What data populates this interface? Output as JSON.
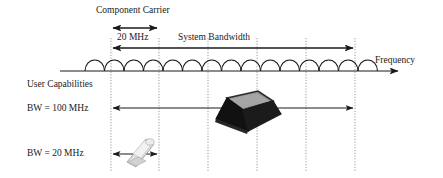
{
  "diagram": {
    "background_color": "#ffffff",
    "stroke_color": "#1a1a1a",
    "labels": {
      "component_carrier": "Component Carrier",
      "carrier_width": "20 MHz",
      "system_bandwidth": "System Bandwidth",
      "frequency_axis": "Frequency",
      "user_capabilities": "User Capabilities",
      "bw_100": "BW = 100 MHz",
      "bw_20": "BW = 20 MHz"
    },
    "axis": {
      "name": "frequency-axis",
      "y": 71,
      "x_start": 60,
      "x_end": 400,
      "arrow": "right"
    },
    "carrier_arcs": {
      "name": "component-carrier-arcs",
      "count": 15,
      "x_start": 85,
      "x_end": 378,
      "arc_width": 19.5,
      "arc_height": 11,
      "baseline_y": 71
    },
    "grid_lines": {
      "name": "carrier-boundary-dotted-lines",
      "style": "dotted",
      "color": "#9a9a9a",
      "x_positions": [
        111,
        159,
        208,
        257,
        306,
        355
      ],
      "y_top": 38,
      "y_bottom": 172
    },
    "measures": [
      {
        "name": "carrier-width-arrow",
        "label": "20 MHz",
        "x_start": 111,
        "x_end": 159,
        "y": 28,
        "arrows": "both"
      },
      {
        "name": "system-bandwidth-arrow",
        "label": "System Bandwidth",
        "x_start": 111,
        "x_end": 355,
        "y": 48,
        "arrows": "both"
      },
      {
        "name": "bw-100-arrow",
        "label": "BW = 100 MHz",
        "x_start": 111,
        "x_end": 355,
        "y": 108,
        "arrows": "both"
      },
      {
        "name": "bw-20-arrow",
        "label": "BW = 20 MHz",
        "x_start": 111,
        "x_end": 159,
        "y": 154,
        "arrows": "both"
      }
    ],
    "devices": [
      {
        "name": "laptop-illustration",
        "represents": "BW = 100 MHz capable device",
        "center_x": 243,
        "center_y": 113,
        "body_color": "#111111",
        "screen_color": "#8e8e8e"
      },
      {
        "name": "phone-illustration",
        "represents": "BW = 20 MHz capable device",
        "center_x": 137,
        "center_y": 152,
        "body_color": "#d9d9d9",
        "outline_color": "#9a9a9a"
      }
    ]
  }
}
